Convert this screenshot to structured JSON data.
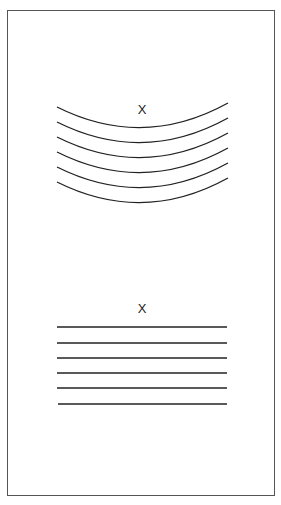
{
  "diagram": {
    "top_panel": {
      "label": "X",
      "description": "Six parallel curved wavefronts bending concave-up below a point X",
      "curve_count": 6
    },
    "bottom_panel": {
      "label": "X",
      "description": "Six parallel straight horizontal lines below a point X",
      "line_count": 6
    },
    "colors": {
      "line": "#222222",
      "border": "#555555",
      "background": "#ffffff"
    }
  }
}
